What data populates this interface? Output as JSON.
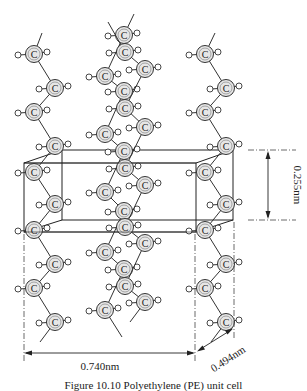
{
  "figure": {
    "caption": "Figure 10.10 Polyethylene (PE) unit cell",
    "atom_label": "C",
    "dimensions": {
      "a_label": "0.740nm",
      "b_label": "0.494nm",
      "c_label": "0.255nm"
    }
  },
  "diagram_data": {
    "type": "crystal-structure",
    "unit_cell": {
      "back_face": {
        "x1": 62,
        "y1": 150,
        "x2": 233,
        "y2": 220
      },
      "front_face": {
        "x1": 24,
        "y1": 163,
        "x2": 196,
        "y2": 232
      }
    },
    "chains": [
      {
        "name": "left-chain",
        "top_stub": [
          42,
          33
        ],
        "bottom_stub": [
          40,
          342
        ],
        "atoms": [
          [
            34,
            54
          ],
          [
            55,
            88
          ],
          [
            34,
            112
          ],
          [
            55,
            146
          ],
          [
            34,
            172
          ],
          [
            55,
            204
          ],
          [
            34,
            230
          ],
          [
            55,
            264
          ],
          [
            34,
            288
          ],
          [
            55,
            322
          ]
        ]
      },
      {
        "name": "right-chain",
        "top_stub": [
          215,
          33
        ],
        "bottom_stub": [
          211,
          342
        ],
        "atoms": [
          [
            205,
            54
          ],
          [
            226,
            88
          ],
          [
            205,
            112
          ],
          [
            226,
            146
          ],
          [
            205,
            172
          ],
          [
            226,
            204
          ],
          [
            205,
            230
          ],
          [
            226,
            264
          ],
          [
            205,
            288
          ],
          [
            226,
            322
          ]
        ]
      },
      {
        "name": "middle-chain-a",
        "top_stub": [
          134,
          14
        ],
        "bottom_stub": [
          122,
          337
        ],
        "atoms": [
          [
            124,
            35
          ],
          [
            105,
            76
          ],
          [
            124,
            91
          ],
          [
            105,
            134
          ],
          [
            124,
            151
          ],
          [
            105,
            192
          ],
          [
            124,
            211
          ],
          [
            105,
            252
          ],
          [
            124,
            269
          ],
          [
            105,
            310
          ]
        ]
      },
      {
        "name": "middle-chain-b",
        "top_stub": [
          108,
          22
        ],
        "bottom_stub": [
          130,
          322
        ],
        "atoms": [
          [
            125,
            52
          ],
          [
            145,
            69
          ],
          [
            125,
            108
          ],
          [
            145,
            127
          ],
          [
            125,
            168
          ],
          [
            145,
            185
          ],
          [
            125,
            227
          ],
          [
            145,
            243
          ],
          [
            125,
            286
          ],
          [
            145,
            302
          ]
        ]
      }
    ]
  }
}
